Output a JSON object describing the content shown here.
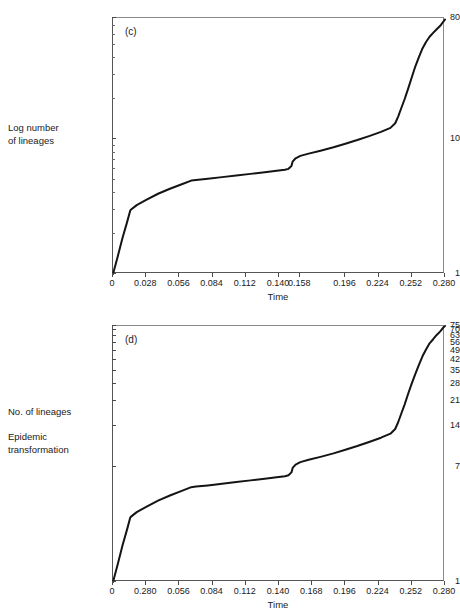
{
  "figure": {
    "background": "#ffffff",
    "curve_color": "#141414",
    "axis_color": "#555555"
  },
  "panels": [
    {
      "tag": "(c)",
      "side_label": "Log number\nof lineages",
      "xlabel": "Time",
      "ytick_labels": [
        "80",
        "10",
        "1"
      ],
      "xtick_labels": [
        "0",
        "0.028",
        "0.056",
        "0.084",
        "0.112",
        "0.140",
        "0.158",
        "0.196",
        "0.224",
        "0.252",
        "0.280"
      ]
    },
    {
      "tag": "(d)",
      "side_label": "No. of lineages\n\nEpidemic\ntransformation",
      "xlabel": "Time",
      "ytick_labels": [
        "75",
        "70",
        "63",
        "56",
        "49",
        "42",
        "35",
        "28",
        "21",
        "14",
        "7",
        "1"
      ],
      "xtick_labels": [
        "0",
        "0.280",
        "0.056",
        "0.084",
        "0.112",
        "0.140",
        "0.168",
        "0.196",
        "0.224",
        "0.252",
        "0.280"
      ]
    }
  ],
  "chart_data": [
    {
      "type": "line",
      "panel": "(c)",
      "title": "",
      "xlabel": "Time",
      "ylabel": "Log number of lineages",
      "yscale": "log",
      "xlim": [
        0,
        0.28
      ],
      "ylim": [
        1,
        80
      ],
      "ytick_values": [
        1,
        10,
        80
      ],
      "yminor_ticks": [
        2,
        3,
        4,
        5,
        6,
        7,
        8,
        9,
        20,
        30,
        40,
        50,
        60,
        70
      ],
      "xtick_values": [
        0,
        0.028,
        0.056,
        0.084,
        0.112,
        0.14,
        0.158,
        0.196,
        0.224,
        0.252,
        0.28
      ],
      "grid": false,
      "legend": "none",
      "x": [
        0.0,
        0.004,
        0.008,
        0.012,
        0.0145,
        0.015,
        0.02,
        0.028,
        0.038,
        0.048,
        0.058,
        0.066,
        0.07,
        0.08,
        0.092,
        0.104,
        0.116,
        0.128,
        0.138,
        0.145,
        0.148,
        0.1505,
        0.1515,
        0.154,
        0.158,
        0.165,
        0.175,
        0.186,
        0.196,
        0.206,
        0.216,
        0.226,
        0.234,
        0.238,
        0.2405,
        0.243,
        0.246,
        0.249,
        0.252,
        0.255,
        0.258,
        0.261,
        0.264,
        0.267,
        0.27,
        0.273,
        0.276,
        0.2785,
        0.28
      ],
      "y": [
        1.0,
        1.35,
        1.85,
        2.45,
        2.95,
        3.0,
        3.25,
        3.55,
        3.95,
        4.3,
        4.65,
        4.95,
        5.0,
        5.1,
        5.25,
        5.4,
        5.55,
        5.7,
        5.85,
        5.95,
        6.05,
        6.35,
        6.85,
        7.25,
        7.55,
        7.85,
        8.25,
        8.75,
        9.3,
        9.9,
        10.6,
        11.4,
        12.2,
        13.2,
        14.8,
        17.0,
        20.0,
        24.0,
        29.0,
        35.0,
        41.0,
        47.5,
        53.0,
        58.0,
        62.0,
        66.0,
        70.0,
        75.0,
        78.0
      ]
    },
    {
      "type": "line",
      "panel": "(d)",
      "title": "",
      "xlabel": "Time",
      "ylabel": "No. of lineages (Epidemic transformation)",
      "yscale": "log",
      "xlim": [
        0,
        0.28
      ],
      "ylim": [
        1,
        75
      ],
      "ytick_values": [
        1,
        7,
        14,
        21,
        28,
        35,
        42,
        49,
        56,
        63,
        70,
        75
      ],
      "xtick_values": [
        0,
        0.028,
        0.056,
        0.084,
        0.112,
        0.14,
        0.168,
        0.196,
        0.224,
        0.252,
        0.28
      ],
      "grid": false,
      "legend": "none",
      "x": [
        0.0,
        0.004,
        0.008,
        0.012,
        0.0145,
        0.015,
        0.02,
        0.028,
        0.038,
        0.048,
        0.058,
        0.066,
        0.07,
        0.08,
        0.092,
        0.104,
        0.116,
        0.128,
        0.138,
        0.145,
        0.148,
        0.1505,
        0.1515,
        0.154,
        0.158,
        0.165,
        0.175,
        0.186,
        0.196,
        0.206,
        0.216,
        0.226,
        0.234,
        0.238,
        0.2405,
        0.243,
        0.246,
        0.249,
        0.252,
        0.255,
        0.258,
        0.261,
        0.264,
        0.267,
        0.27,
        0.273,
        0.276,
        0.2785,
        0.28
      ],
      "y": [
        1.0,
        1.35,
        1.85,
        2.45,
        2.95,
        3.0,
        3.25,
        3.55,
        3.95,
        4.3,
        4.65,
        4.95,
        5.0,
        5.1,
        5.25,
        5.4,
        5.55,
        5.7,
        5.85,
        5.95,
        6.05,
        6.35,
        6.85,
        7.25,
        7.55,
        7.85,
        8.25,
        8.75,
        9.3,
        9.9,
        10.6,
        11.4,
        12.2,
        13.2,
        14.8,
        17.0,
        20.0,
        24.0,
        28.5,
        33.5,
        39.0,
        45.0,
        50.5,
        56.0,
        60.0,
        64.5,
        68.5,
        73.0,
        75.0
      ]
    }
  ]
}
